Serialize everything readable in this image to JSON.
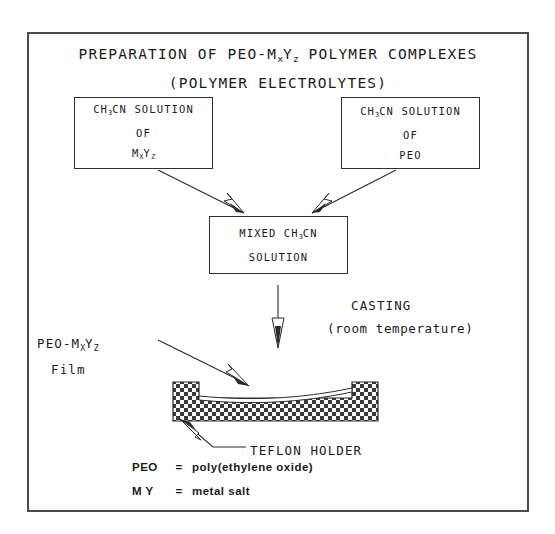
{
  "diagram": {
    "title": {
      "line1_pre": "PREPARATION OF PEO-M",
      "line1_sub1": "x",
      "line1_mid": "Y",
      "line1_sub2": "z",
      "line1_post": " POLYMER COMPLEXES",
      "line2": "(POLYMER ELECTROLYTES)"
    },
    "box_left": {
      "line1_pre": "CH",
      "line1_sub": "3",
      "line1_post": "CN SOLUTION",
      "line2": "OF",
      "line3_pre": "M",
      "line3_sub1": "X",
      "line3_mid": "Y",
      "line3_sub2": "Z"
    },
    "box_right": {
      "line1_pre": "CH",
      "line1_sub": "3",
      "line1_post": "CN SOLUTION",
      "line2": "OF",
      "line3": "PEO"
    },
    "box_mixed": {
      "line1_pre": "MIXED CH",
      "line1_sub": "3",
      "line1_post": "CN",
      "line2": "SOLUTION"
    },
    "casting": {
      "label": "CASTING",
      "sublabel": "(room temperature)"
    },
    "film": {
      "line1_pre": "PEO-M",
      "line1_sub1": "X",
      "line1_mid": "Y",
      "line1_sub2": "Z",
      "line2": "Film"
    },
    "teflon": {
      "label": "TEFLON HOLDER"
    },
    "legend": [
      {
        "key": "PEO",
        "eq": "=",
        "value": "poly(ethylene oxide)"
      },
      {
        "key": "M Y",
        "eq": "=",
        "value": "metal salt"
      }
    ],
    "colors": {
      "ink": "#1a1a1a",
      "frame": "#4a4a52",
      "box_border": "#2e2e34",
      "hatch": "#3a3a3a",
      "background": "#ffffff"
    }
  }
}
